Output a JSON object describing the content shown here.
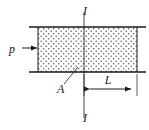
{
  "figure": {
    "type": "engineering-cross-section-diagram",
    "canvas": {
      "width": 149,
      "height": 130,
      "background": "#ffffff"
    },
    "colors": {
      "line": "#1a1a1a",
      "hatch": "#4d4d4d",
      "fill": "#fcfcfc",
      "text": "#1a1a1a"
    },
    "block": {
      "name": "hatched-section",
      "x": 38,
      "y": 27,
      "width": 99,
      "height": 45,
      "fill_pattern": "stipple-dots"
    },
    "boundary_lines": [
      {
        "name": "top-boundary-line",
        "x1": 29,
        "y1": 27,
        "x2": 146,
        "y2": 27
      },
      {
        "name": "bottom-boundary-line",
        "x1": 29,
        "y1": 72,
        "x2": 146,
        "y2": 72
      }
    ],
    "section_line": {
      "name": "section-line-I-I",
      "x": 84,
      "y_top": 12,
      "y_bottom": 118,
      "top_label": "I",
      "bottom_label": "I"
    },
    "pressure": {
      "name": "pressure-load",
      "label": "p",
      "label_x": 12,
      "label_y": 52,
      "arrow_x1": 22,
      "arrow_x2": 38,
      "arrow_y": 48
    },
    "area_callout": {
      "name": "area-callout",
      "label": "A",
      "label_x": 58,
      "label_y": 92,
      "leader_x1": 64,
      "leader_y1": 84,
      "leader_x2": 78,
      "leader_y2": 68
    },
    "dimension": {
      "name": "length-dimension",
      "label": "L",
      "label_x": 107,
      "label_y": 83,
      "line_y": 89,
      "x_start": 84,
      "x_end": 137,
      "ext_top": 72,
      "ext_bottom": 96
    }
  }
}
